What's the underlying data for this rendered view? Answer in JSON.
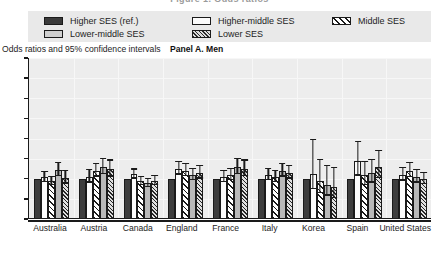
{
  "title": "Figure 1. Odds ratios",
  "legend": {
    "rows": [
      [
        {
          "label": "Higher SES (ref.)",
          "swatch": "solid-dark-square-icon",
          "key": "higher"
        },
        {
          "label": "Higher-middle SES",
          "swatch": "outline-white-square-icon",
          "key": "hmiddle"
        },
        {
          "label": "Middle SES",
          "swatch": "diagonal-hatch-square-icon",
          "key": "middle"
        }
      ],
      [
        {
          "label": "Lower-middle SES",
          "swatch": "solid-gray-square-icon",
          "key": "lmiddle"
        },
        {
          "label": "Lower SES",
          "swatch": "dense-hatch-square-icon",
          "key": "lower"
        }
      ]
    ]
  },
  "axis_note": "Odds ratios and 95% confidence intervals",
  "panel_label": "Panel A. Men",
  "chart_data": {
    "type": "bar",
    "title": "Panel A. Men",
    "subtitle": "Odds ratios and 95% confidence intervals",
    "xlabel": "",
    "ylabel": "Odds ratios and 95% confidence intervals",
    "ylim": [
      0,
      4.0
    ],
    "yticks": [
      "0",
      "0.5",
      "1.0",
      "1.5",
      "2.0",
      "2.5",
      "3.0",
      "3.5",
      "4.0"
    ],
    "ytick_values": [
      0,
      0.5,
      1.0,
      1.5,
      2.0,
      2.5,
      3.0,
      3.5,
      4.0
    ],
    "grid": true,
    "legend_position": "top",
    "categories": [
      "Australia",
      "Austria",
      "Canada",
      "England",
      "France",
      "Italy",
      "Korea",
      "Spain",
      "United States"
    ],
    "series": [
      {
        "name": "Higher SES (ref.)",
        "key": "higher",
        "values": [
          1.0,
          1.0,
          1.0,
          1.0,
          1.0,
          1.0,
          1.0,
          1.0,
          1.0
        ],
        "ci_low": [
          1.0,
          1.0,
          1.0,
          1.0,
          1.0,
          1.0,
          1.0,
          1.0,
          1.0
        ],
        "ci_high": [
          1.0,
          1.0,
          1.0,
          1.0,
          1.0,
          1.0,
          1.0,
          1.0,
          1.0
        ]
      },
      {
        "name": "Higher-middle SES",
        "key": "hmiddle",
        "values": [
          1.05,
          1.05,
          1.12,
          1.25,
          1.05,
          1.1,
          1.12,
          1.45,
          1.1
        ],
        "ci_low": [
          0.92,
          0.9,
          1.0,
          1.1,
          0.92,
          0.96,
          0.75,
          1.08,
          0.95
        ],
        "ci_high": [
          1.2,
          1.25,
          1.26,
          1.45,
          1.22,
          1.27,
          2.0,
          1.95,
          1.3
        ]
      },
      {
        "name": "Middle SES",
        "key": "middle",
        "values": [
          0.95,
          1.2,
          0.95,
          1.2,
          1.1,
          1.05,
          0.95,
          1.1,
          1.2
        ],
        "ci_low": [
          0.85,
          1.05,
          0.84,
          1.06,
          0.96,
          0.92,
          0.65,
          0.85,
          1.04
        ],
        "ci_high": [
          1.08,
          1.4,
          1.08,
          1.4,
          1.28,
          1.22,
          1.5,
          1.45,
          1.42
        ]
      },
      {
        "name": "Lower-middle SES",
        "key": "lmiddle",
        "values": [
          1.22,
          1.3,
          0.9,
          1.1,
          1.3,
          1.2,
          0.85,
          1.15,
          1.05
        ],
        "ci_low": [
          1.06,
          1.12,
          0.8,
          0.96,
          1.12,
          1.05,
          0.58,
          0.9,
          0.9
        ],
        "ci_high": [
          1.42,
          1.52,
          1.03,
          1.28,
          1.52,
          1.4,
          1.35,
          1.5,
          1.25
        ]
      },
      {
        "name": "Lower SES",
        "key": "lower",
        "values": [
          1.02,
          1.25,
          0.95,
          1.15,
          1.25,
          1.15,
          0.8,
          1.3,
          1.0
        ],
        "ci_low": [
          0.88,
          1.05,
          0.84,
          1.0,
          1.06,
          1.0,
          0.52,
          1.02,
          0.86
        ],
        "ci_high": [
          1.22,
          1.48,
          1.1,
          1.35,
          1.48,
          1.35,
          1.3,
          1.72,
          1.18
        ]
      }
    ]
  }
}
